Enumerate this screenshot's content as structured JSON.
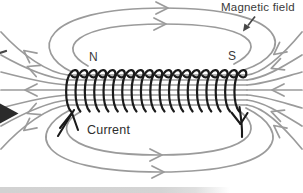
{
  "diagram": {
    "type": "solenoid-magnetic-field-diagram",
    "magnetic_field_label": "Magnetic field",
    "north_pole_label": "N",
    "south_pole_label": "S",
    "current_label": "Current",
    "field_direction": "arrows exit N pole (left), loop over top and bottom to the right, and enter S pole (right)",
    "coil_turns": 19
  },
  "colors": {
    "background": "#ffffff",
    "field_line": "#9b9b9b",
    "coil_wire": "#1a1a1a",
    "label_text": "#3a3a3a",
    "annotation_arrow": "#474747",
    "edge_arrowhead": "#2b2b2b",
    "bottom_strip": "#d4d4d4"
  },
  "icons": {
    "field_chevron": "field-direction-chevron",
    "pointer": "magnetic-field-pointer-arrow",
    "edge_arrow": "left-edge-arrowhead"
  }
}
